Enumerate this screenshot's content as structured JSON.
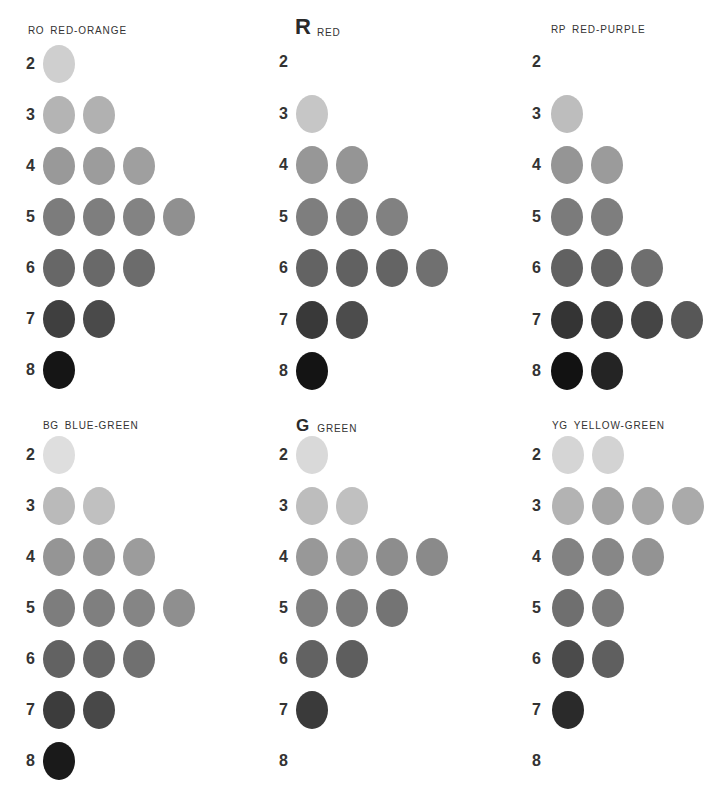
{
  "chart_data": {
    "type": "table",
    "value_levels": [
      2,
      3,
      4,
      5,
      6,
      7,
      8
    ],
    "series": [
      {
        "code": "RO",
        "name": "RED-ORANGE",
        "counts": [
          1,
          2,
          3,
          4,
          3,
          2,
          1
        ]
      },
      {
        "code": "R",
        "name": "RED",
        "counts": [
          0,
          1,
          2,
          3,
          4,
          2,
          1
        ]
      },
      {
        "code": "RP",
        "name": "RED-PURPLE",
        "counts": [
          0,
          1,
          2,
          2,
          3,
          4,
          2
        ]
      },
      {
        "code": "BG",
        "name": "BLUE-GREEN",
        "counts": [
          1,
          2,
          3,
          4,
          3,
          2,
          1
        ]
      },
      {
        "code": "G",
        "name": "GREEN",
        "counts": [
          1,
          2,
          4,
          3,
          2,
          1,
          0
        ]
      },
      {
        "code": "YG",
        "name": "YELLOW-GREEN",
        "counts": [
          2,
          4,
          3,
          2,
          2,
          1,
          0
        ]
      }
    ]
  },
  "colors": {
    "value_2": "#d6d6d6",
    "value_3": "#b9b9b9",
    "value_4": "#9a9a9a",
    "value_5": "#808080",
    "value_6": "#6a6a6a",
    "value_7": "#474747",
    "value_8": "#1c1c1c",
    "text": "#2a2a2a"
  },
  "panels": [
    {
      "code": "RO",
      "name": "RED-ORANGE",
      "code_style": "small",
      "rows": [
        {
          "label": "2",
          "shades": [
            "#cfcfcf"
          ]
        },
        {
          "label": "3",
          "shades": [
            "#b4b4b4",
            "#b1b1b1"
          ]
        },
        {
          "label": "4",
          "shades": [
            "#999999",
            "#9c9c9c",
            "#9f9f9f"
          ]
        },
        {
          "label": "5",
          "shades": [
            "#7c7c7c",
            "#7e7e7e",
            "#838383",
            "#909090"
          ]
        },
        {
          "label": "6",
          "shades": [
            "#676767",
            "#696969",
            "#6c6c6c"
          ]
        },
        {
          "label": "7",
          "shades": [
            "#3f3f3f",
            "#4a4a4a"
          ]
        },
        {
          "label": "8",
          "shades": [
            "#151515"
          ]
        }
      ]
    },
    {
      "code": "R",
      "name": "RED",
      "code_style": "big",
      "rows": [
        {
          "label": "2",
          "shades": []
        },
        {
          "label": "3",
          "shades": [
            "#c6c6c6"
          ]
        },
        {
          "label": "4",
          "shades": [
            "#979797",
            "#959595"
          ]
        },
        {
          "label": "5",
          "shades": [
            "#7e7e7e",
            "#7d7d7d",
            "#818181"
          ]
        },
        {
          "label": "6",
          "shades": [
            "#636363",
            "#616161",
            "#646464",
            "#707070"
          ]
        },
        {
          "label": "7",
          "shades": [
            "#393939",
            "#4c4c4c"
          ]
        },
        {
          "label": "8",
          "shades": [
            "#141414"
          ]
        }
      ]
    },
    {
      "code": "RP",
      "name": "RED-PURPLE",
      "code_style": "small",
      "rows": [
        {
          "label": "2",
          "shades": []
        },
        {
          "label": "3",
          "shades": [
            "#bdbdbd"
          ]
        },
        {
          "label": "4",
          "shades": [
            "#959595",
            "#9b9b9b"
          ]
        },
        {
          "label": "5",
          "shades": [
            "#7b7b7b",
            "#7e7e7e"
          ]
        },
        {
          "label": "6",
          "shades": [
            "#616161",
            "#636363",
            "#6e6e6e"
          ]
        },
        {
          "label": "7",
          "shades": [
            "#343434",
            "#3d3d3d",
            "#454545",
            "#575757"
          ]
        },
        {
          "label": "8",
          "shades": [
            "#121212",
            "#242424"
          ]
        }
      ]
    },
    {
      "code": "BG",
      "name": "BLUE-GREEN",
      "code_style": "small",
      "rows": [
        {
          "label": "2",
          "shades": [
            "#dedede"
          ]
        },
        {
          "label": "3",
          "shades": [
            "#bababa",
            "#c0c0c0"
          ]
        },
        {
          "label": "4",
          "shades": [
            "#959595",
            "#939393",
            "#9c9c9c"
          ]
        },
        {
          "label": "5",
          "shades": [
            "#7d7d7d",
            "#7f7f7f",
            "#858585",
            "#8f8f8f"
          ]
        },
        {
          "label": "6",
          "shades": [
            "#626262",
            "#666666",
            "#707070"
          ]
        },
        {
          "label": "7",
          "shades": [
            "#3c3c3c",
            "#484848"
          ]
        },
        {
          "label": "8",
          "shades": [
            "#1a1a1a"
          ]
        }
      ]
    },
    {
      "code": "G",
      "name": "GREEN",
      "code_style": "mid",
      "rows": [
        {
          "label": "2",
          "shades": [
            "#d9d9d9"
          ]
        },
        {
          "label": "3",
          "shades": [
            "#bdbdbd",
            "#c0c0c0"
          ]
        },
        {
          "label": "4",
          "shades": [
            "#989898",
            "#9e9e9e",
            "#8d8d8d",
            "#8a8a8a"
          ]
        },
        {
          "label": "5",
          "shades": [
            "#7f7f7f",
            "#7b7b7b",
            "#747474"
          ]
        },
        {
          "label": "6",
          "shades": [
            "#626262",
            "#5e5e5e"
          ]
        },
        {
          "label": "7",
          "shades": [
            "#3a3a3a"
          ]
        },
        {
          "label": "8",
          "shades": []
        }
      ]
    },
    {
      "code": "YG",
      "name": "YELLOW-GREEN",
      "code_style": "small",
      "rows": [
        {
          "label": "2",
          "shades": [
            "#d5d5d5",
            "#d3d3d3"
          ]
        },
        {
          "label": "3",
          "shades": [
            "#b3b3b3",
            "#a4a4a4",
            "#a6a6a6",
            "#aaaaaa"
          ]
        },
        {
          "label": "4",
          "shades": [
            "#828282",
            "#878787",
            "#939393"
          ]
        },
        {
          "label": "5",
          "shades": [
            "#6f6f6f",
            "#7a7a7a"
          ]
        },
        {
          "label": "6",
          "shades": [
            "#4b4b4b",
            "#5f5f5f"
          ]
        },
        {
          "label": "7",
          "shades": [
            "#2a2a2a"
          ]
        },
        {
          "label": "8",
          "shades": []
        }
      ]
    }
  ]
}
